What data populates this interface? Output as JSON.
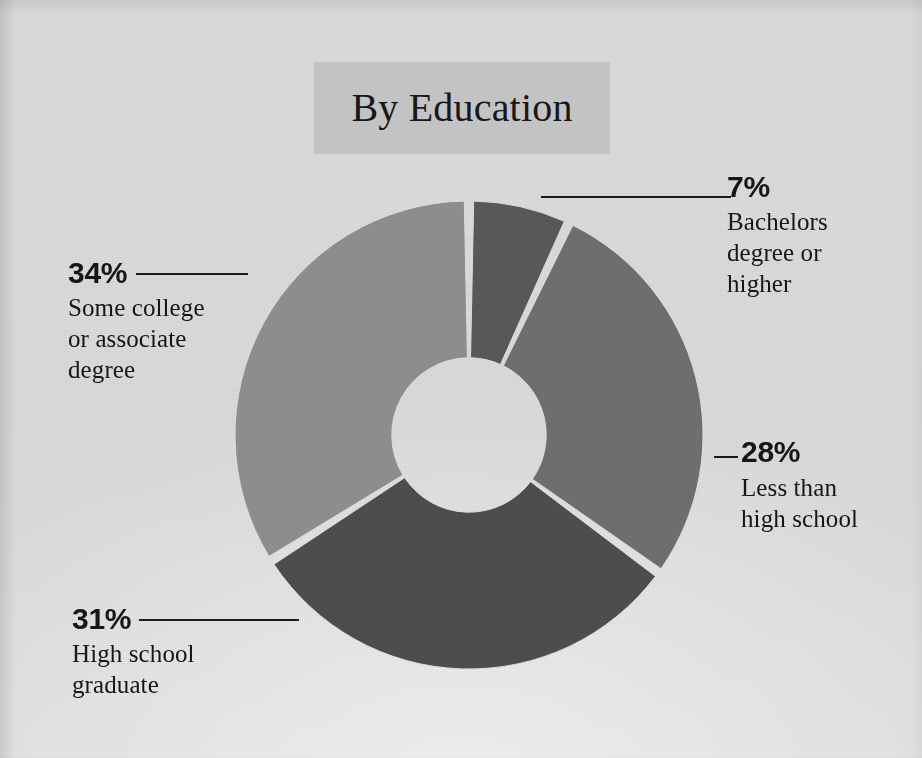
{
  "header": {
    "title": "By Education",
    "title_band_color": "#c3c3c3"
  },
  "canvas": {
    "background_color": "#dcdcdc",
    "text_color": "#15151a",
    "leader_color": "#1b1b1f"
  },
  "chart_data": {
    "type": "pie",
    "variant": "donut",
    "title": "By Education",
    "subtitle": "",
    "xlabel": "",
    "ylabel": "",
    "grid": false,
    "legend_position": "callout-labels",
    "value_unit": "%",
    "total": 100,
    "start_angle_deg": 0,
    "direction": "clockwise",
    "inner_radius_ratio": 0.33,
    "labels": [
      "Bachelors degree or higher",
      "Less than high school",
      "High school graduate",
      "Some college or associate degree"
    ],
    "values": [
      7,
      28,
      31,
      34
    ],
    "colors": [
      "#58585a",
      "#6e6e70",
      "#4d4d50",
      "#8d8d8f"
    ],
    "slices": [
      {
        "label": "Bachelors degree or higher",
        "label_lines": [
          "Bachelors",
          "degree or",
          "higher"
        ],
        "value": 7,
        "value_text": "7%",
        "color": "#58585a",
        "callout_side": "top-right"
      },
      {
        "label": "Less than high school",
        "label_lines": [
          "Less than",
          "high school"
        ],
        "value": 28,
        "value_text": "28%",
        "color": "#6e6e70",
        "callout_side": "right"
      },
      {
        "label": "High school graduate",
        "label_lines": [
          "High school",
          "graduate"
        ],
        "value": 31,
        "value_text": "31%",
        "color": "#4d4d50",
        "callout_side": "bottom-left"
      },
      {
        "label": "Some college or associate degree",
        "label_lines": [
          "Some college",
          "or associate",
          "degree"
        ],
        "value": 34,
        "value_text": "34%",
        "color": "#8d8d8f",
        "callout_side": "left"
      }
    ]
  },
  "callouts": {
    "bachelors": {
      "value_text": "7%",
      "line1": "Bachelors",
      "line2": "degree or",
      "line3": "higher"
    },
    "less_than_hs": {
      "value_text": "28%",
      "line1": "Less than",
      "line2": "high school"
    },
    "some_college": {
      "value_text": "34%",
      "line1": "Some college",
      "line2": "or associate",
      "line3": "degree"
    },
    "hs_graduate": {
      "value_text": "31%",
      "line1": "High school",
      "line2": "graduate"
    }
  }
}
